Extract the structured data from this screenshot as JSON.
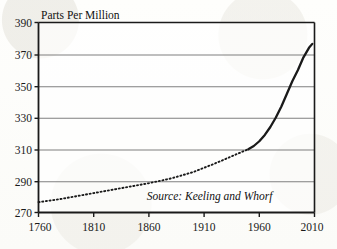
{
  "chart_data": {
    "type": "line",
    "title": "Parts Per Million",
    "xlabel": "",
    "ylabel": "Parts Per Million",
    "xlim": [
      1760,
      2010
    ],
    "ylim": [
      270,
      390
    ],
    "grid": "horizontal",
    "legend": "none",
    "xticks": [
      1760,
      1810,
      1860,
      1910,
      1960,
      2010
    ],
    "xtick_labels": [
      "1760",
      "1810",
      "1860",
      "1910",
      "1960",
      "2010"
    ],
    "yticks": [
      270,
      290,
      310,
      330,
      350,
      370,
      390
    ],
    "ytick_labels": [
      "270",
      "290",
      "310",
      "330",
      "350",
      "370",
      "390"
    ],
    "annotations": [
      {
        "name": "source-note",
        "text": "Source: Keeling and Whorf",
        "x": 1915,
        "y": 278,
        "style": "italic"
      }
    ],
    "series": [
      {
        "name": "Atmospheric CO2 (proxy record)",
        "style": "dotted",
        "color": "#1a1a1a",
        "x": [
          1760,
          1780,
          1800,
          1820,
          1840,
          1860,
          1880,
          1900,
          1920,
          1940,
          1950
        ],
        "values": [
          276.5,
          278.5,
          281.0,
          283.5,
          286.0,
          288.5,
          291.5,
          295.5,
          301.0,
          307.0,
          310.0
        ]
      },
      {
        "name": "Atmospheric CO2 (Mauna Loa record)",
        "style": "solid",
        "color": "#1a1a1a",
        "x": [
          1950,
          1955,
          1960,
          1965,
          1970,
          1975,
          1980,
          1985,
          1990,
          1995,
          2000,
          2005,
          2008
        ],
        "values": [
          310.0,
          312.0,
          315.0,
          319.0,
          324.0,
          330.0,
          337.0,
          345.0,
          353.0,
          360.0,
          368.0,
          374.0,
          376.5
        ]
      }
    ]
  },
  "figure": {
    "background_color": "#fdfdfb",
    "axis_color": "#1a1a1a",
    "gridline_color": "#7f7f7f"
  }
}
